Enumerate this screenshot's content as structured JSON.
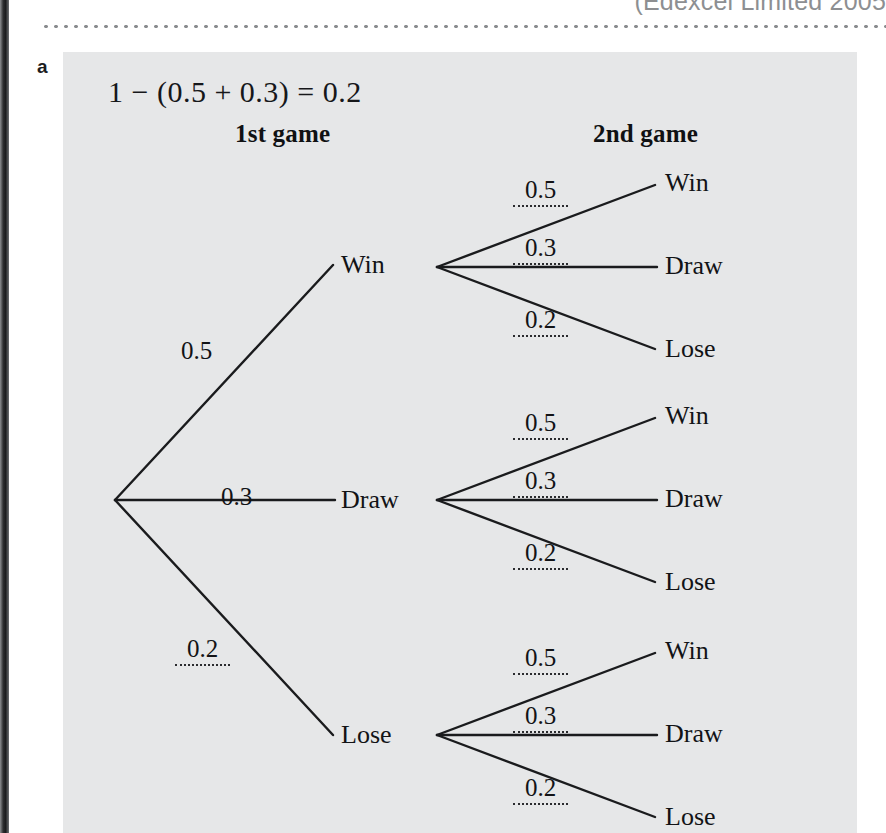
{
  "page": {
    "running_header": "(Edexcel Limited 2005",
    "part_letter": "a",
    "working_line": "1 − (0.5 + 0.3) = 0.2"
  },
  "headings": {
    "first": "1st game",
    "second": "2nd game"
  },
  "tree": {
    "level1": [
      {
        "prob": "0.5",
        "outcome": "Win",
        "blank": false
      },
      {
        "prob": "0.3",
        "outcome": "Draw",
        "blank": false
      },
      {
        "prob": "0.2",
        "outcome": "Lose",
        "blank": true
      }
    ],
    "level2_groups": [
      {
        "parent": "Win",
        "branches": [
          {
            "prob": "0.5",
            "outcome": "Win",
            "blank": true
          },
          {
            "prob": "0.3",
            "outcome": "Draw",
            "blank": true
          },
          {
            "prob": "0.2",
            "outcome": "Lose",
            "blank": true
          }
        ]
      },
      {
        "parent": "Draw",
        "branches": [
          {
            "prob": "0.5",
            "outcome": "Win",
            "blank": true
          },
          {
            "prob": "0.3",
            "outcome": "Draw",
            "blank": true
          },
          {
            "prob": "0.2",
            "outcome": "Lose",
            "blank": true
          }
        ]
      },
      {
        "parent": "Lose",
        "branches": [
          {
            "prob": "0.5",
            "outcome": "Win",
            "blank": true
          },
          {
            "prob": "0.3",
            "outcome": "Draw",
            "blank": true
          },
          {
            "prob": "0.2",
            "outcome": "Lose",
            "blank": true
          }
        ]
      }
    ]
  },
  "colors": {
    "panel_background": "#e6e7e8",
    "page_background": "#ffffff",
    "ink": "#121316",
    "rule_dots": "#8a8c8f",
    "spine": "#1b1c1e"
  }
}
